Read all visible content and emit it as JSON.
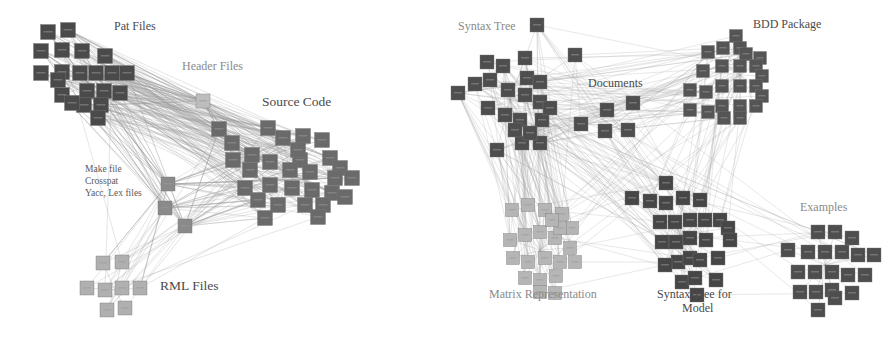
{
  "figure_left": {
    "name": "module-graph-left",
    "edge_color": "#9a9a9a",
    "labels": [
      {
        "id": "pat-files",
        "text": "Pat Files",
        "x": 114,
        "y": 29,
        "style": "dark"
      },
      {
        "id": "header-files",
        "text": "Header Files",
        "x": 182,
        "y": 69,
        "style": "light"
      },
      {
        "id": "source-code",
        "text": "Source Code",
        "x": 262,
        "y": 103,
        "style": "dark big"
      },
      {
        "id": "make-file",
        "text": "Make file",
        "x": 85,
        "y": 172,
        "style": "small"
      },
      {
        "id": "crosspat",
        "text": "Crosspat",
        "x": 85,
        "y": 184,
        "style": "small"
      },
      {
        "id": "yacc-lex",
        "text": "Yacc, Lex files",
        "x": 85,
        "y": 196,
        "style": "small"
      },
      {
        "id": "rml-files",
        "text": "RML Files",
        "x": 160,
        "y": 287,
        "style": "dark big"
      }
    ],
    "clusters": [
      {
        "id": "pat",
        "fill": "#4a4a4a",
        "size": 15,
        "hub": [
          90,
          85
        ],
        "nodes": [
          [
            48,
            32
          ],
          [
            68,
            30
          ],
          [
            41,
            51
          ],
          [
            62,
            50
          ],
          [
            82,
            51
          ],
          [
            105,
            56
          ],
          [
            41,
            73
          ],
          [
            62,
            72
          ],
          [
            80,
            73
          ],
          [
            96,
            73
          ],
          [
            112,
            73
          ],
          [
            127,
            73
          ],
          [
            62,
            95
          ],
          [
            87,
            91
          ],
          [
            104,
            91
          ],
          [
            120,
            93
          ],
          [
            84,
            105
          ],
          [
            101,
            105
          ],
          [
            98,
            118
          ],
          [
            72,
            103
          ],
          [
            58,
            80
          ]
        ]
      },
      {
        "id": "header",
        "fill": "#bdbdbd",
        "size": 14,
        "hub": [
          204,
          104
        ],
        "nodes": [
          [
            203,
            101
          ]
        ]
      },
      {
        "id": "source",
        "fill": "#6a6a6a",
        "size": 15,
        "hub": [
          290,
          175
        ],
        "nodes": [
          [
            219,
            129
          ],
          [
            232,
            143
          ],
          [
            268,
            128
          ],
          [
            283,
            138
          ],
          [
            303,
            136
          ],
          [
            322,
            140
          ],
          [
            300,
            160
          ],
          [
            330,
            158
          ],
          [
            340,
            168
          ],
          [
            233,
            160
          ],
          [
            252,
            155
          ],
          [
            270,
            162
          ],
          [
            290,
            170
          ],
          [
            310,
            172
          ],
          [
            335,
            178
          ],
          [
            352,
            178
          ],
          [
            270,
            185
          ],
          [
            292,
            188
          ],
          [
            312,
            190
          ],
          [
            332,
            193
          ],
          [
            345,
            197
          ],
          [
            245,
            188
          ],
          [
            258,
            200
          ],
          [
            278,
            205
          ],
          [
            305,
            205
          ],
          [
            323,
            205
          ],
          [
            265,
            218
          ],
          [
            318,
            217
          ],
          [
            250,
            170
          ],
          [
            298,
            150
          ]
        ]
      },
      {
        "id": "make",
        "fill": "#8a8a8a",
        "size": 14,
        "hub": [
          175,
          200
        ],
        "nodes": [
          [
            168,
            184
          ],
          [
            165,
            208
          ],
          [
            185,
            226
          ]
        ]
      },
      {
        "id": "rml",
        "fill": "#b0b0b0",
        "size": 14,
        "hub": [
          115,
          290
        ],
        "nodes": [
          [
            103,
            263
          ],
          [
            122,
            262
          ],
          [
            87,
            288
          ],
          [
            105,
            290
          ],
          [
            122,
            288
          ],
          [
            140,
            288
          ],
          [
            107,
            310
          ],
          [
            125,
            308
          ]
        ]
      }
    ],
    "links": [
      [
        "pat",
        "source",
        140
      ],
      [
        "pat",
        "header",
        30
      ],
      [
        "pat",
        "make",
        40
      ],
      [
        "header",
        "source",
        25
      ],
      [
        "make",
        "source",
        60
      ],
      [
        "rml",
        "make",
        18
      ],
      [
        "rml",
        "source",
        10
      ],
      [
        "pat",
        "rml",
        2
      ]
    ]
  },
  "figure_right": {
    "name": "module-graph-right",
    "edge_color": "#a5a5a5",
    "labels": [
      {
        "id": "syntax-tree",
        "text": "Syntax Tree",
        "x": 458,
        "y": 29,
        "style": "light"
      },
      {
        "id": "bdd-package",
        "text": "BDD Package",
        "x": 753,
        "y": 27,
        "style": "dark"
      },
      {
        "id": "documents",
        "text": "Documents",
        "x": 588,
        "y": 86,
        "style": "dark"
      },
      {
        "id": "examples",
        "text": "Examples",
        "x": 800,
        "y": 210,
        "style": "light"
      },
      {
        "id": "matrix-rep",
        "text": "Matrix Representation",
        "x": 489,
        "y": 297,
        "style": "light"
      },
      {
        "id": "syntax-tree-model-1",
        "text": "Syntax Tree for",
        "x": 657,
        "y": 297,
        "style": "dark"
      },
      {
        "id": "syntax-tree-model-2",
        "text": "Model",
        "x": 682,
        "y": 311,
        "style": "dark"
      }
    ],
    "clusters": [
      {
        "id": "syntax",
        "fill": "#4e4e4e",
        "size": 14,
        "hub": [
          510,
          100
        ],
        "nodes": [
          [
            537,
            25
          ],
          [
            575,
            55
          ],
          [
            458,
            93
          ],
          [
            475,
            84
          ],
          [
            487,
            62
          ],
          [
            503,
            66
          ],
          [
            525,
            58
          ],
          [
            527,
            78
          ],
          [
            490,
            80
          ],
          [
            508,
            90
          ],
          [
            525,
            95
          ],
          [
            540,
            82
          ],
          [
            540,
            102
          ],
          [
            488,
            108
          ],
          [
            505,
            115
          ],
          [
            520,
            120
          ],
          [
            542,
            120
          ],
          [
            550,
            108
          ],
          [
            497,
            150
          ],
          [
            522,
            143
          ],
          [
            540,
            143
          ],
          [
            515,
            130
          ],
          [
            530,
            133
          ]
        ]
      },
      {
        "id": "docs",
        "fill": "#4e4e4e",
        "size": 14,
        "hub": [
          600,
          125
        ],
        "nodes": [
          [
            607,
            110
          ],
          [
            633,
            103
          ],
          [
            581,
            124
          ],
          [
            605,
            131
          ],
          [
            628,
            130
          ]
        ]
      },
      {
        "id": "bdd",
        "fill": "#555555",
        "size": 13,
        "hub": [
          740,
          75
        ],
        "nodes": [
          [
            736,
            36
          ],
          [
            708,
            52
          ],
          [
            723,
            48
          ],
          [
            740,
            48
          ],
          [
            746,
            54
          ],
          [
            760,
            58
          ],
          [
            703,
            71
          ],
          [
            722,
            66
          ],
          [
            740,
            66
          ],
          [
            756,
            66
          ],
          [
            762,
            76
          ],
          [
            690,
            90
          ],
          [
            706,
            92
          ],
          [
            722,
            86
          ],
          [
            740,
            86
          ],
          [
            756,
            86
          ],
          [
            762,
            96
          ],
          [
            690,
            110
          ],
          [
            708,
            112
          ],
          [
            722,
            106
          ],
          [
            740,
            106
          ],
          [
            756,
            106
          ],
          [
            724,
            118
          ],
          [
            740,
            118
          ]
        ]
      },
      {
        "id": "matrix",
        "fill": "#b5b5b5",
        "size": 13,
        "hub": [
          540,
          250
        ],
        "nodes": [
          [
            512,
            210
          ],
          [
            528,
            205
          ],
          [
            545,
            210
          ],
          [
            562,
            214
          ],
          [
            572,
            228
          ],
          [
            510,
            240
          ],
          [
            525,
            235
          ],
          [
            540,
            232
          ],
          [
            555,
            238
          ],
          [
            570,
            248
          ],
          [
            513,
            258
          ],
          [
            528,
            262
          ],
          [
            545,
            258
          ],
          [
            560,
            262
          ],
          [
            575,
            262
          ],
          [
            525,
            278
          ],
          [
            540,
            280
          ],
          [
            556,
            276
          ],
          [
            540,
            292
          ],
          [
            555,
            293
          ],
          [
            560,
            228
          ],
          [
            552,
            220
          ]
        ]
      },
      {
        "id": "model",
        "fill": "#464646",
        "size": 14,
        "hub": [
          680,
          235
        ],
        "nodes": [
          [
            666,
            183
          ],
          [
            632,
            198
          ],
          [
            650,
            201
          ],
          [
            666,
            203
          ],
          [
            683,
            198
          ],
          [
            700,
            200
          ],
          [
            660,
            222
          ],
          [
            675,
            222
          ],
          [
            690,
            220
          ],
          [
            705,
            220
          ],
          [
            720,
            220
          ],
          [
            728,
            228
          ],
          [
            730,
            240
          ],
          [
            662,
            242
          ],
          [
            676,
            242
          ],
          [
            690,
            238
          ],
          [
            706,
            240
          ],
          [
            678,
            262
          ],
          [
            690,
            258
          ],
          [
            700,
            260
          ],
          [
            718,
            258
          ],
          [
            665,
            265
          ],
          [
            682,
            282
          ],
          [
            695,
            278
          ],
          [
            716,
            280
          ],
          [
            697,
            295
          ]
        ]
      },
      {
        "id": "examples",
        "fill": "#4e4e4e",
        "size": 14,
        "hub": [
          825,
          265
        ],
        "nodes": [
          [
            788,
            250
          ],
          [
            818,
            232
          ],
          [
            835,
            232
          ],
          [
            852,
            238
          ],
          [
            808,
            252
          ],
          [
            825,
            252
          ],
          [
            842,
            252
          ],
          [
            858,
            255
          ],
          [
            874,
            255
          ],
          [
            798,
            272
          ],
          [
            815,
            272
          ],
          [
            832,
            272
          ],
          [
            848,
            275
          ],
          [
            865,
            275
          ],
          [
            800,
            292
          ],
          [
            816,
            292
          ],
          [
            832,
            290
          ],
          [
            852,
            293
          ],
          [
            818,
            310
          ],
          [
            835,
            298
          ]
        ]
      }
    ],
    "links": [
      [
        "syntax",
        "matrix",
        80
      ],
      [
        "syntax",
        "model",
        40
      ],
      [
        "syntax",
        "docs",
        25
      ],
      [
        "syntax",
        "bdd",
        40
      ],
      [
        "docs",
        "bdd",
        15
      ],
      [
        "docs",
        "model",
        15
      ],
      [
        "bdd",
        "model",
        25
      ],
      [
        "bdd",
        "matrix",
        10
      ],
      [
        "model",
        "examples",
        10
      ],
      [
        "syntax",
        "examples",
        6
      ],
      [
        "matrix",
        "model",
        8
      ]
    ]
  }
}
